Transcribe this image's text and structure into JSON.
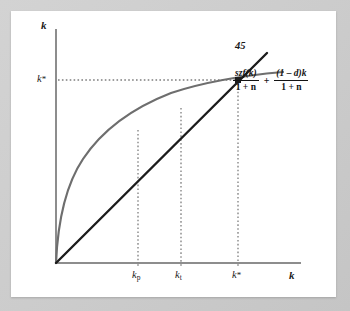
{
  "figure": {
    "type": "economics-diagram",
    "model_name": "Solow growth model steady state diagram"
  },
  "axes": {
    "y_label": "k",
    "x_label": "k"
  },
  "annotations": {
    "line_45_label": "45",
    "equation": {
      "term1_numerator": "szf(k)",
      "term1_denominator": "1 + n",
      "operator": "+",
      "term2_numerator": "(1 – d)k",
      "term2_denominator": "1 + n"
    }
  },
  "ticks": {
    "x": [
      {
        "name": "k-sub-p",
        "base": "k",
        "sub": "p",
        "sup": "",
        "x": 127
      },
      {
        "name": "k-sub-t",
        "base": "k",
        "sub": "t",
        "sup": "",
        "x": 170
      },
      {
        "name": "k-star",
        "base": "k",
        "sub": "",
        "sup": "*",
        "x": 227
      }
    ],
    "y": [
      {
        "name": "k-star",
        "base": "k",
        "sub": "",
        "sup": "*",
        "y": 69
      }
    ]
  },
  "colors": {
    "background": "#c9c9c9",
    "panel": "#ffffff",
    "axis": "#8a8a8a",
    "curve_production": "#6e6e6e",
    "line_45": "#1a1a1a",
    "dotted_guide": "#808080",
    "text": "#1a1a1a"
  },
  "chart_data": {
    "type": "line",
    "title": "",
    "xlabel": "k",
    "ylabel": "k",
    "grid": false,
    "legend": "none",
    "xlim": [
      0,
      1
    ],
    "ylim": [
      0,
      1
    ],
    "series": [
      {
        "name": "szf(k)/(1+n) + (1-d)k/(1+n)",
        "style": "concave-curve",
        "color": "#6e6e6e",
        "points_px": [
          [
            45,
            252
          ],
          [
            48,
            215
          ],
          [
            53,
            188
          ],
          [
            60,
            168
          ],
          [
            70,
            148
          ],
          [
            83,
            130
          ],
          [
            98,
            114
          ],
          [
            115,
            100
          ],
          [
            133,
            90
          ],
          [
            152,
            82
          ],
          [
            172,
            75
          ],
          [
            192,
            71
          ],
          [
            212,
            68
          ],
          [
            227,
            67
          ],
          [
            245,
            64
          ],
          [
            262,
            62
          ],
          [
            272,
            61
          ]
        ]
      },
      {
        "name": "45-degree line",
        "style": "straight-line",
        "color": "#1a1a1a",
        "points_px": [
          [
            45,
            252
          ],
          [
            256,
            42
          ]
        ]
      }
    ],
    "markers": [
      {
        "name": "steady-state-intersection",
        "x_px": 227,
        "y_px": 69
      }
    ],
    "guides": [
      {
        "name": "vertical-k-p",
        "orientation": "vertical",
        "x_px": 127,
        "y_from": 119,
        "y_to": 252
      },
      {
        "name": "vertical-k-t",
        "orientation": "vertical",
        "x_px": 170,
        "y_from": 97,
        "y_to": 252
      },
      {
        "name": "vertical-k-star",
        "orientation": "vertical",
        "x_px": 227,
        "y_from": 69,
        "y_to": 252
      },
      {
        "name": "horizontal-k-star",
        "orientation": "horizontal",
        "y_px": 69,
        "x_from": 47,
        "x_to": 227
      }
    ]
  }
}
